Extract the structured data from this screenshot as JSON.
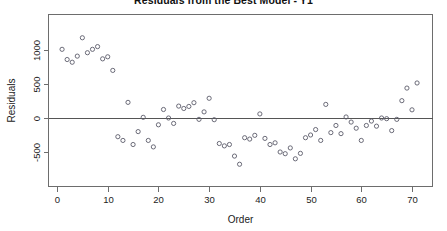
{
  "chart_data": {
    "type": "scatter",
    "title": "Residuals from the Best Model - Y1",
    "xlabel": "Order",
    "ylabel": "Residuals",
    "xlim": [
      -2,
      74
    ],
    "ylim": [
      -800,
      1300
    ],
    "xticks": [
      0,
      10,
      20,
      30,
      40,
      50,
      60,
      70
    ],
    "yticks": [
      -500,
      0,
      500,
      1000
    ],
    "xtick_labels": [
      "0",
      "10",
      "20",
      "30",
      "40",
      "50",
      "60",
      "70"
    ],
    "ytick_labels": [
      "-500",
      "0",
      "500",
      "1000"
    ],
    "grid": false,
    "legend": "none",
    "reference_lines": [
      {
        "name": "zero-line",
        "orientation": "horizontal",
        "y": 0
      }
    ],
    "marker": {
      "shape": "open-circle",
      "radius_px": 2.1,
      "stroke": "#5b5b6a",
      "fill": "none"
    },
    "series": [
      {
        "name": "residuals",
        "x": [
          1,
          2,
          3,
          4,
          5,
          6,
          7,
          8,
          9,
          10,
          11,
          12,
          13,
          14,
          15,
          16,
          17,
          18,
          19,
          20,
          21,
          22,
          23,
          24,
          25,
          26,
          27,
          28,
          29,
          30,
          31,
          32,
          33,
          34,
          35,
          36,
          37,
          38,
          39,
          40,
          41,
          42,
          43,
          44,
          45,
          46,
          47,
          48,
          49,
          50,
          51,
          52,
          53,
          54,
          55,
          56,
          57,
          58,
          59,
          60,
          61,
          62,
          63,
          64,
          65,
          66,
          67,
          68,
          69,
          70,
          71
        ],
        "y": [
          1010,
          860,
          820,
          910,
          1180,
          960,
          1010,
          1050,
          870,
          900,
          700,
          -275,
          -330,
          230,
          -390,
          -200,
          10,
          -330,
          -425,
          -100,
          125,
          0,
          -80,
          175,
          140,
          170,
          225,
          -20,
          90,
          290,
          -25,
          -375,
          -410,
          -390,
          -560,
          -680,
          -290,
          -310,
          -255,
          60,
          -300,
          -390,
          -365,
          -500,
          -525,
          -440,
          -600,
          -520,
          -290,
          -250,
          -170,
          -330,
          200,
          -215,
          -110,
          -230,
          15,
          -60,
          -150,
          -330,
          -110,
          -45,
          -120,
          0,
          -10,
          -185,
          -20,
          255,
          440,
          120,
          515
        ]
      }
    ]
  }
}
